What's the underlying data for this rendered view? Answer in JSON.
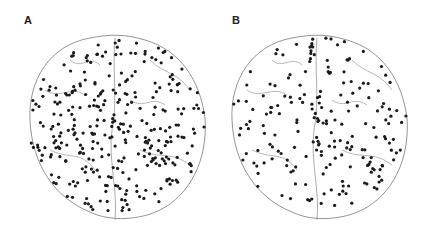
{
  "figure": {
    "panels": [
      {
        "label": "A",
        "description": "Brain render (top view) with dense electrode markers"
      },
      {
        "label": "B",
        "description": "Brain render (top view) with sparser electrode markers"
      }
    ],
    "colors": {
      "outline": "#555555",
      "marker": "#1a1a1a",
      "background": "#ffffff"
    }
  }
}
